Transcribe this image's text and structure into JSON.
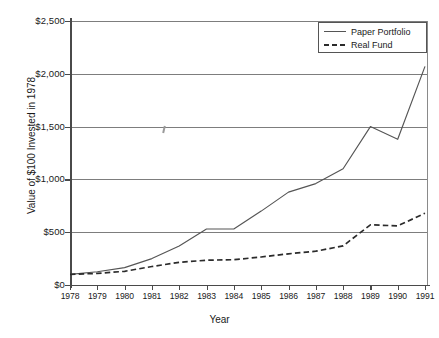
{
  "chart_data": {
    "type": "line",
    "title": "",
    "xlabel": "Year",
    "ylabel": "Value of $100 Invested in 1978",
    "x": [
      1978,
      1979,
      1980,
      1981,
      1982,
      1983,
      1984,
      1985,
      1986,
      1987,
      1988,
      1989,
      1990,
      1991
    ],
    "xtick_labels": [
      "1978",
      "1979",
      "1980",
      "1981",
      "1982",
      "1983",
      "1984",
      "1985",
      "1986",
      "1987",
      "1988",
      "1989",
      "1990",
      "1991"
    ],
    "ytick_labels": [
      "$0",
      "$500",
      "$1,000",
      "$1,500",
      "$2,000",
      "$2,500"
    ],
    "ytick_values": [
      0,
      500,
      1000,
      1500,
      2000,
      2500
    ],
    "ylim": [
      0,
      2500
    ],
    "xlim": [
      1978,
      1991
    ],
    "grid": "horizontal",
    "legend_position": "top-right",
    "series": [
      {
        "name": "Paper Portfolio",
        "style": "solid",
        "color": "#555555",
        "values": [
          100,
          125,
          165,
          250,
          370,
          530,
          530,
          700,
          880,
          960,
          1100,
          1500,
          1380,
          2070
        ]
      },
      {
        "name": "Real Fund",
        "style": "dashed",
        "color": "#2b2b2b",
        "values": [
          100,
          110,
          130,
          175,
          215,
          235,
          240,
          265,
          295,
          320,
          370,
          570,
          560,
          680
        ]
      }
    ]
  },
  "legend": {
    "items": [
      {
        "label": "Paper Portfolio",
        "style": "solid"
      },
      {
        "label": "Real Fund",
        "style": "dashed"
      }
    ]
  },
  "axes": {
    "x_title": "Year",
    "y_title": "Value of $100 Invested in 1978"
  }
}
